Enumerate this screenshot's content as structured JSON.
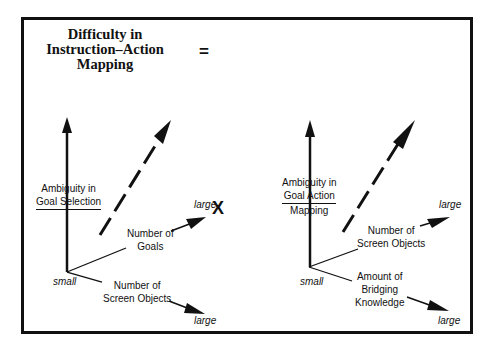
{
  "title": {
    "line1": "Difficulty in",
    "line2": "Instruction–Action",
    "line3": "Mapping"
  },
  "operators": {
    "equals": "=",
    "times": "X"
  },
  "left_plot": {
    "y_axis": {
      "line1": "Ambiguity in",
      "line2": "Goal Selection"
    },
    "axis_goals": {
      "line1": "Number of",
      "line2": "Goals",
      "end": "large"
    },
    "axis_objects": {
      "line1": "Number of",
      "line2": "Screen Objects",
      "end": "large"
    },
    "origin": "small"
  },
  "right_plot": {
    "y_axis": {
      "line1": "Ambiguity in",
      "line2": "Goal Action",
      "line3": "Mapping"
    },
    "axis_objects": {
      "line1": "Number of",
      "line2": "Screen Objects",
      "end": "large"
    },
    "axis_bridging": {
      "line1": "Amount of",
      "line2": "Bridging",
      "line3": "Knowledge",
      "end": "large"
    },
    "origin": "small"
  },
  "colors": {
    "ink": "#111111",
    "background": "#ffffff"
  }
}
